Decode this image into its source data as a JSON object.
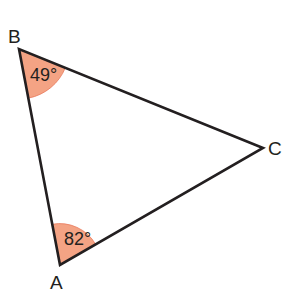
{
  "diagram": {
    "type": "triangle",
    "colors": {
      "edge": "#231f20",
      "angle_fill": "#f4a384",
      "angle_stroke": "#e8795a",
      "background": "#ffffff"
    },
    "vertices": [
      {
        "id": "A",
        "label": "A",
        "x": 60,
        "y": 265
      },
      {
        "id": "B",
        "label": "B",
        "x": 19,
        "y": 49
      },
      {
        "id": "C",
        "label": "C",
        "x": 263,
        "y": 148
      }
    ],
    "angles": [
      {
        "vertex": "B",
        "label": "49°",
        "value": 49
      },
      {
        "vertex": "A",
        "label": "82°",
        "value": 82
      }
    ]
  }
}
